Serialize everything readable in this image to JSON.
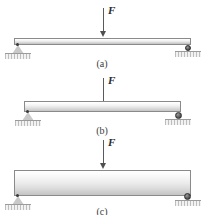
{
  "figure": {
    "background_color": "#ffffff",
    "beam_outline_color": "#8a8a8a",
    "arrow_color": "#4f4f4f",
    "support_color": "#c9c9c9",
    "roller_color": "#333333",
    "ground_hatch_color": "#bdbdbd"
  },
  "panels": [
    {
      "id": "a",
      "caption": "(a)",
      "force_label": "F",
      "beam_name": "shallow-beam",
      "left_support": "pin-support",
      "right_support": "roller-support"
    },
    {
      "id": "b",
      "caption": "(b)",
      "force_label": "F",
      "beam_name": "medium-beam",
      "left_support": "pin-support",
      "right_support": "roller-support"
    },
    {
      "id": "c",
      "caption": "(c)",
      "force_label": "F",
      "beam_name": "deep-beam",
      "left_support": "pin-support",
      "right_support": "roller-support"
    }
  ]
}
